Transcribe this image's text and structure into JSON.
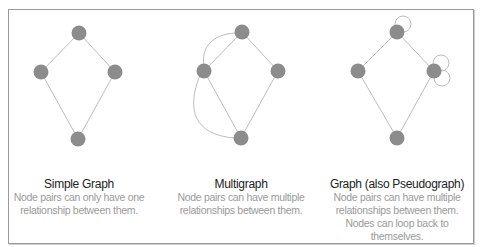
{
  "panels": [
    {
      "title": "Simple Graph",
      "description_lines": [
        "Node pairs can only have one",
        "relationship between them."
      ]
    },
    {
      "title": "Multigraph",
      "description_lines": [
        "Node pairs can have multiple",
        "relationships between them."
      ]
    },
    {
      "title": "Graph (also Pseudograph)",
      "description_lines": [
        "Node pairs can have multiple",
        "relationships between them.",
        "Nodes can loop back to",
        "themselves."
      ]
    }
  ],
  "colors": {
    "node": "#8c8c8c",
    "edge": "#bdbdbd",
    "title": "#222222",
    "description": "#9a9a9a",
    "frame": "#9a9a9a"
  }
}
